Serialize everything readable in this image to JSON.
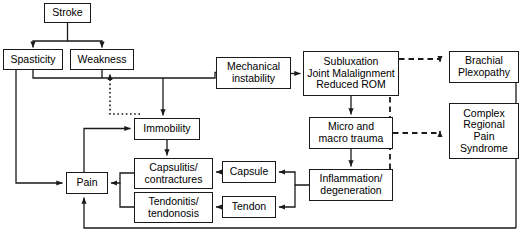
{
  "diagram": {
    "type": "flowchart",
    "width": 523,
    "height": 249,
    "colors": {
      "background": "#ffffff",
      "stroke": "#1a1a1a",
      "text": "#000000"
    },
    "nodes": [
      {
        "id": "stroke",
        "label": "Stroke",
        "x": 44,
        "y": 3,
        "w": 47,
        "h": 20,
        "font": 10.5
      },
      {
        "id": "spasticity",
        "label": "Spasticity",
        "x": 3,
        "y": 49,
        "w": 60,
        "h": 21,
        "font": 10.5
      },
      {
        "id": "weakness",
        "label": "Weakness",
        "x": 70,
        "y": 49,
        "w": 64,
        "h": 21,
        "font": 10.5
      },
      {
        "id": "mech_instab",
        "label": "Mechanical\ninstability",
        "x": 216,
        "y": 57,
        "w": 75,
        "h": 32,
        "font": 10.5
      },
      {
        "id": "subluxation",
        "label": "Subluxation\nJoint Malalignment\nReduced ROM",
        "x": 303,
        "y": 51,
        "w": 96,
        "h": 45,
        "font": 10.5
      },
      {
        "id": "brachial",
        "label": "Brachial\nPlexopathy",
        "x": 449,
        "y": 51,
        "w": 70,
        "h": 32,
        "font": 10.5
      },
      {
        "id": "immobility",
        "label": "Immobility",
        "x": 134,
        "y": 118,
        "w": 66,
        "h": 22,
        "font": 10.5
      },
      {
        "id": "micro_macro",
        "label": "Micro and\nmacro trauma",
        "x": 309,
        "y": 117,
        "w": 84,
        "h": 32,
        "font": 10.5
      },
      {
        "id": "crps",
        "label": "Complex\nRegional\nPain\nSyndrome",
        "x": 449,
        "y": 103,
        "w": 70,
        "h": 56,
        "font": 10.5
      },
      {
        "id": "capsulitis",
        "label": "Capsulitis/\ncontractures",
        "x": 134,
        "y": 158,
        "w": 79,
        "h": 31,
        "font": 10.5
      },
      {
        "id": "capsule",
        "label": "Capsule",
        "x": 222,
        "y": 161,
        "w": 54,
        "h": 22,
        "font": 10.5
      },
      {
        "id": "inflammation",
        "label": "Inflammation/\ndegeneration",
        "x": 309,
        "y": 169,
        "w": 84,
        "h": 32,
        "font": 10.5
      },
      {
        "id": "pain",
        "label": "Pain",
        "x": 66,
        "y": 172,
        "w": 42,
        "h": 22,
        "font": 10.5
      },
      {
        "id": "tendonitis",
        "label": "Tendonitis/\ntendonosis",
        "x": 134,
        "y": 192,
        "w": 79,
        "h": 31,
        "font": 10.5
      },
      {
        "id": "tendon",
        "label": "Tendon",
        "x": 222,
        "y": 196,
        "w": 54,
        "h": 22,
        "font": 10.5
      }
    ],
    "edges": [
      {
        "id": "stroke-to-spasticity",
        "from": "stroke",
        "to": "spasticity",
        "style": "solid"
      },
      {
        "id": "stroke-to-weakness",
        "from": "stroke",
        "to": "weakness",
        "style": "solid"
      },
      {
        "id": "spasticity-weakness-to-mech",
        "from": "spasticity",
        "to": "mech_instab",
        "style": "solid"
      },
      {
        "id": "branch-to-immobility",
        "from": "spasticity",
        "to": "immobility",
        "style": "solid"
      },
      {
        "id": "immobility-to-weakness",
        "from": "immobility",
        "to": "weakness",
        "style": "dotted"
      },
      {
        "id": "mech-to-subluxation",
        "from": "mech_instab",
        "to": "subluxation",
        "style": "solid"
      },
      {
        "id": "subluxation-to-micro",
        "from": "subluxation",
        "to": "micro_macro",
        "style": "solid"
      },
      {
        "id": "subluxation-to-brachial",
        "from": "subluxation",
        "to": "brachial",
        "style": "dashed"
      },
      {
        "id": "subluxation-to-crps",
        "from": "subluxation",
        "to": "crps",
        "style": "dashed"
      },
      {
        "id": "micro-to-crps",
        "from": "micro_macro",
        "to": "crps",
        "style": "dashed"
      },
      {
        "id": "micro-to-inflammation",
        "from": "micro_macro",
        "to": "inflammation",
        "style": "solid"
      },
      {
        "id": "inflammation-to-crps",
        "from": "inflammation",
        "to": "crps",
        "style": "dashed"
      },
      {
        "id": "inflammation-to-capsule",
        "from": "inflammation",
        "to": "capsule",
        "style": "solid"
      },
      {
        "id": "inflammation-to-tendon",
        "from": "inflammation",
        "to": "tendon",
        "style": "solid"
      },
      {
        "id": "capsule-to-capsulitis",
        "from": "capsule",
        "to": "capsulitis",
        "style": "solid"
      },
      {
        "id": "tendon-to-tendonitis",
        "from": "tendon",
        "to": "tendonitis",
        "style": "solid"
      },
      {
        "id": "immobility-to-capsulitis",
        "from": "immobility",
        "to": "capsulitis",
        "style": "solid"
      },
      {
        "id": "capsulitis-tendonitis-pain",
        "from": "capsulitis",
        "to": "pain",
        "style": "solid"
      },
      {
        "id": "spasticity-to-pain",
        "from": "spasticity",
        "to": "pain",
        "style": "solid"
      },
      {
        "id": "pain-to-immobility",
        "from": "pain",
        "to": "immobility",
        "style": "solid"
      },
      {
        "id": "right-return-to-pain",
        "from": "crps",
        "to": "pain",
        "style": "solid"
      }
    ]
  }
}
